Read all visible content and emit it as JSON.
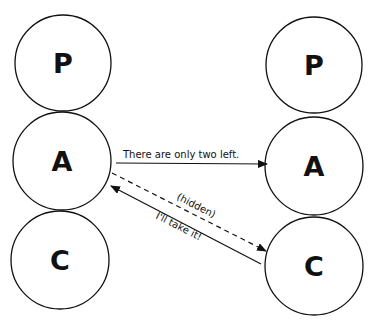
{
  "diagram": {
    "type": "transactional-analysis",
    "left_person": {
      "states": [
        {
          "label": "P",
          "cx": 63,
          "cy": 63,
          "r": 48
        },
        {
          "label": "A",
          "cx": 62,
          "cy": 161,
          "r": 49
        },
        {
          "label": "C",
          "cx": 60,
          "cy": 260,
          "r": 49
        }
      ]
    },
    "right_person": {
      "states": [
        {
          "label": "P",
          "cx": 314,
          "cy": 65,
          "r": 48
        },
        {
          "label": "A",
          "cx": 314,
          "cy": 166,
          "r": 49
        },
        {
          "label": "C",
          "cx": 314,
          "cy": 266,
          "r": 49
        }
      ]
    },
    "transactions": [
      {
        "label": "There are only two left.",
        "from": "left-A",
        "to": "right-A",
        "style": "solid"
      },
      {
        "label": "(hidden)",
        "from": "left-A",
        "to": "right-C",
        "style": "dashed"
      },
      {
        "label": "I'll take it!",
        "from": "right-C",
        "to": "left-A",
        "style": "solid"
      }
    ]
  }
}
